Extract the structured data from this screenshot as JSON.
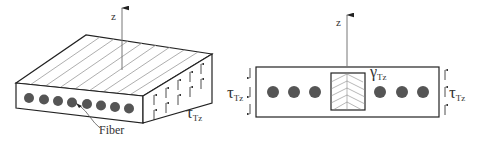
{
  "left_figure": {
    "axis_label": "z",
    "stress_label": "τ",
    "stress_subscript": "Tz",
    "fiber_label": "Fiber",
    "fiber_count": 8,
    "grain_line_count": 9
  },
  "right_figure": {
    "axis_label": "z",
    "left_stress_label": "τ",
    "left_stress_subscript": "Tz",
    "right_stress_label": "τ",
    "right_stress_subscript": "Tz",
    "strain_label": "γ",
    "strain_subscript": "Tz",
    "fibers_left": 3,
    "fibers_right": 3
  },
  "colors": {
    "line": "#222222",
    "fiber": "#555555",
    "grain": "#999999",
    "background": "#ffffff"
  }
}
